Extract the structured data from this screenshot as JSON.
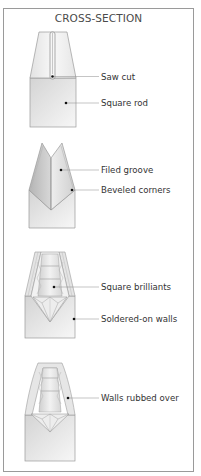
{
  "title": "CROSS-SECTION",
  "colors": {
    "frame": "#9a9a9a",
    "metal_light": "#f4f4f4",
    "metal_mid": "#d8d8d8",
    "metal_dark": "#b8b8b8",
    "outline": "#9a9a9a",
    "leader": "#8a8a8a",
    "dot": "#111111"
  },
  "stages": [
    {
      "name": "saw-cut-stage",
      "callouts": [
        {
          "label": "Saw cut",
          "y": 77
        },
        {
          "label": "Square rod",
          "y": 102
        }
      ]
    },
    {
      "name": "filed-groove-stage",
      "callouts": [
        {
          "label": "Filed groove",
          "y": 170
        },
        {
          "label": "Beveled corners",
          "y": 191
        }
      ]
    },
    {
      "name": "soldered-walls-stage",
      "callouts": [
        {
          "label": "Square brilliants",
          "y": 287
        },
        {
          "label": "Soldered-on walls",
          "y": 319
        }
      ]
    },
    {
      "name": "rubbed-over-stage",
      "callouts": [
        {
          "label": "Walls rubbed over",
          "y": 399
        }
      ]
    }
  ]
}
